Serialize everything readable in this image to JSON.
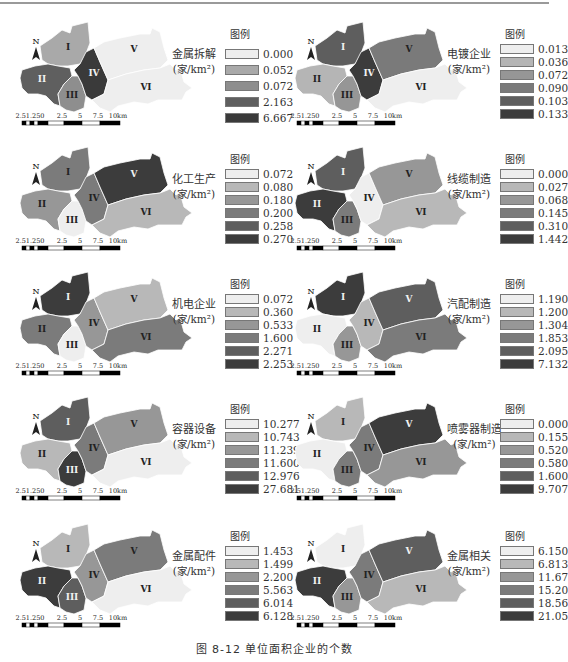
{
  "figure": {
    "caption": "图 8-12   单位面积企业的个数",
    "legend_heading": "图例",
    "unit": "(家/km²)",
    "north_label": "N",
    "scale_labels": [
      "2.51.250",
      "2.5",
      "5",
      "7.5",
      "10km"
    ],
    "region_labels": [
      "I",
      "II",
      "III",
      "IV",
      "V",
      "VI"
    ]
  },
  "chart_data": [
    {
      "type": "choropleth",
      "title": "金属拆解",
      "unit": "家/km²",
      "legend": [
        "0.000",
        "0.052",
        "0.072",
        "2.163",
        "6.667"
      ],
      "legend_colors": [
        "#eeeeee",
        "#a9a9a9",
        "#8e8e8e",
        "#5f5f5f",
        "#3a3a3a"
      ],
      "regions": {
        "I": "0.052",
        "II": "2.163",
        "III": "0.072",
        "IV": "6.667",
        "V": "0.000",
        "VI": "0.000"
      }
    },
    {
      "type": "choropleth",
      "title": "电镀企业",
      "unit": "家/km²",
      "legend": [
        "0.013",
        "0.036",
        "0.072",
        "0.090",
        "0.103",
        "0.133"
      ],
      "legend_colors": [
        "#eeeeee",
        "#b5b5b5",
        "#969696",
        "#7a7a7a",
        "#5e5e5e",
        "#3c3c3c"
      ],
      "regions": {
        "I": "0.103",
        "II": "0.036",
        "III": "0.072",
        "IV": "0.133",
        "V": "0.090",
        "VI": "0.013"
      }
    },
    {
      "type": "choropleth",
      "title": "化工生产",
      "unit": "家/km²",
      "legend": [
        "0.072",
        "0.080",
        "0.180",
        "0.200",
        "0.258",
        "0.270"
      ],
      "legend_colors": [
        "#eeeeee",
        "#b8b8b8",
        "#979797",
        "#7b7b7b",
        "#5e5e5e",
        "#3c3c3c"
      ],
      "regions": {
        "I": "0.200",
        "II": "0.180",
        "III": "0.072",
        "IV": "0.200",
        "V": "0.270",
        "VI": "0.080"
      }
    },
    {
      "type": "choropleth",
      "title": "线缆制造",
      "unit": "家/km²",
      "legend": [
        "0.000",
        "0.027",
        "0.068",
        "0.145",
        "0.310",
        "1.442"
      ],
      "legend_colors": [
        "#eeeeee",
        "#b8b8b8",
        "#979797",
        "#7b7b7b",
        "#5e5e5e",
        "#3c3c3c"
      ],
      "regions": {
        "I": "0.310",
        "II": "1.442",
        "III": "0.145",
        "IV": "0.000",
        "V": "0.068",
        "VI": "0.027"
      }
    },
    {
      "type": "choropleth",
      "title": "机电企业",
      "unit": "家/km²",
      "legend": [
        "0.072",
        "0.360",
        "0.533",
        "1.600",
        "2.271",
        "2.253"
      ],
      "legend_colors": [
        "#eeeeee",
        "#b8b8b8",
        "#979797",
        "#7b7b7b",
        "#5e5e5e",
        "#3c3c3c"
      ],
      "regions": {
        "I": "2.253",
        "II": "1.600",
        "III": "0.072",
        "IV": "0.533",
        "V": "0.360",
        "VI": "1.600"
      }
    },
    {
      "type": "choropleth",
      "title": "汽配制造",
      "unit": "家/km²",
      "legend": [
        "1.190",
        "1.200",
        "1.304",
        "1.853",
        "2.095",
        "7.132"
      ],
      "legend_colors": [
        "#eeeeee",
        "#b8b8b8",
        "#979797",
        "#7b7b7b",
        "#5e5e5e",
        "#3c3c3c"
      ],
      "regions": {
        "I": "7.132",
        "II": "1.190",
        "III": "1.304",
        "IV": "1.200",
        "V": "2.095",
        "VI": "1.853"
      }
    },
    {
      "type": "choropleth",
      "title": "容器设备",
      "unit": "家/km²",
      "legend": [
        "10.277",
        "10.743",
        "11.239",
        "11.600",
        "12.976",
        "27.681"
      ],
      "legend_colors": [
        "#eeeeee",
        "#b8b8b8",
        "#979797",
        "#7b7b7b",
        "#5e5e5e",
        "#3c3c3c"
      ],
      "regions": {
        "I": "12.976",
        "II": "10.743",
        "III": "27.681",
        "IV": "11.600",
        "V": "11.239",
        "VI": "10.277"
      }
    },
    {
      "type": "choropleth",
      "title": "喷雾器制造",
      "unit": "家/km²",
      "legend": [
        "0.000",
        "0.155",
        "0.520",
        "0.580",
        "1.600",
        "9.707"
      ],
      "legend_colors": [
        "#eeeeee",
        "#b8b8b8",
        "#979797",
        "#7b7b7b",
        "#5e5e5e",
        "#3c3c3c"
      ],
      "regions": {
        "I": "0.155",
        "II": "0.000",
        "III": "0.580",
        "IV": "0.580",
        "V": "9.707",
        "VI": "0.520"
      }
    },
    {
      "type": "choropleth",
      "title": "金属配件",
      "unit": "家/km²",
      "legend": [
        "1.453",
        "1.499",
        "2.200",
        "5.563",
        "6.014",
        "6.128"
      ],
      "legend_colors": [
        "#eeeeee",
        "#b8b8b8",
        "#979797",
        "#7b7b7b",
        "#5e5e5e",
        "#3c3c3c"
      ],
      "regions": {
        "I": "1.499",
        "II": "6.128",
        "III": "6.014",
        "IV": "2.200",
        "V": "5.563",
        "VI": "1.453"
      }
    },
    {
      "type": "choropleth",
      "title": "金属相关",
      "unit": "家/km²",
      "legend": [
        "6.150",
        "6.813",
        "11.67",
        "15.20",
        "18.56",
        "21.05"
      ],
      "legend_colors": [
        "#eeeeee",
        "#b8b8b8",
        "#979797",
        "#7b7b7b",
        "#5e5e5e",
        "#3c3c3c"
      ],
      "regions": {
        "I": "6.150",
        "II": "21.05",
        "III": "11.67",
        "IV": "15.20",
        "V": "18.56",
        "VI": "6.813"
      }
    }
  ]
}
